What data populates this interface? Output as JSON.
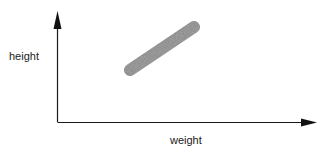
{
  "diagram": {
    "type": "scatter-trend-sketch",
    "y_axis_label": "height",
    "x_axis_label": "weight",
    "trend": "positive correlation band",
    "colors": {
      "axis": "#1a1a1a",
      "band": "#8c8c8c",
      "background": "#ffffff"
    }
  }
}
